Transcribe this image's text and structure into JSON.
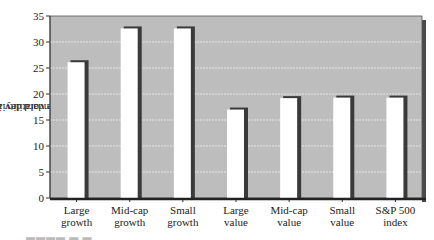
{
  "chart_data": {
    "type": "bar",
    "title": "",
    "xlabel": "",
    "ylabel": "Average volatility in percent (standard deviation)",
    "ylabel_lines": [
      "Average volatility in percent",
      "(standard deviation)"
    ],
    "ylim": [
      0,
      35
    ],
    "yticks": [
      0,
      5,
      10,
      15,
      20,
      25,
      30,
      35
    ],
    "grid": true,
    "legend": null,
    "categories": [
      "Large growth",
      "Mid-cap growth",
      "Small growth",
      "Large value",
      "Mid-cap value",
      "Small value",
      "S&P 500 index"
    ],
    "category_lines": [
      [
        "Large",
        "growth"
      ],
      [
        "Mid-cap",
        "growth"
      ],
      [
        "Small",
        "growth"
      ],
      [
        "Large",
        "value"
      ],
      [
        "Mid-cap",
        "value"
      ],
      [
        "Small",
        "value"
      ],
      [
        "S&P 500",
        "index"
      ]
    ],
    "values": [
      26.3,
      32.8,
      32.8,
      17.2,
      19.4,
      19.5,
      19.5
    ]
  },
  "colors": {
    "plot_bg": "#bdbdbd",
    "grid": "#e6e6e6",
    "bar_fill": "#ffffff",
    "bar_shadow": "#3a3a3a",
    "axis": "#333333"
  }
}
